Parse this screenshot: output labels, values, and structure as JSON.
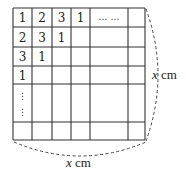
{
  "diagram": {
    "grid": {
      "rows": [
        [
          "1",
          "2",
          "3",
          "1",
          "⋯ ⋯",
          ""
        ],
        [
          "2",
          "3",
          "1",
          "",
          "",
          ""
        ],
        [
          "3",
          "1",
          "",
          "",
          "",
          ""
        ],
        [
          "1",
          "",
          "",
          "",
          "",
          ""
        ],
        [
          "⋮",
          "",
          "",
          "",
          "",
          ""
        ],
        [
          "",
          "",
          "",
          "",
          "",
          ""
        ]
      ]
    },
    "labels": {
      "right": {
        "var": "x",
        "unit": " cm"
      },
      "bottom": {
        "var": "x",
        "unit": " cm"
      }
    }
  }
}
